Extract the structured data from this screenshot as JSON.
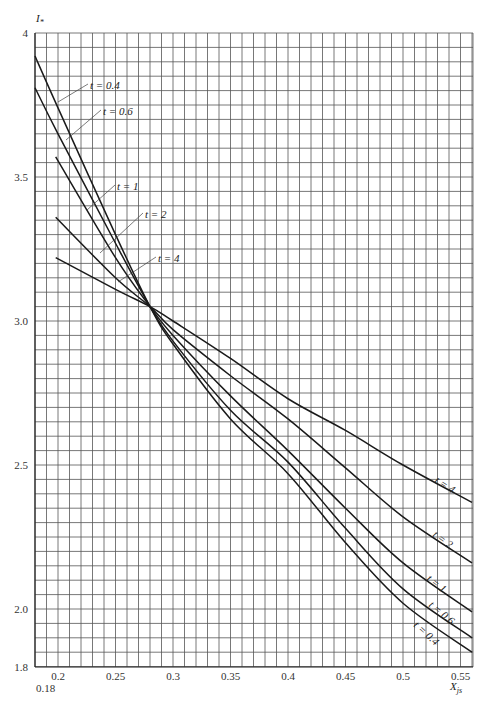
{
  "chart_data": {
    "type": "line",
    "title": "",
    "xlabel": "X_js",
    "ylabel": "I*",
    "xlim": [
      0.18,
      0.56
    ],
    "ylim": [
      1.8,
      4.0
    ],
    "grid": true,
    "x_ticks": [
      "0.2",
      "0.25",
      "0.3",
      "0.35",
      "0.4",
      "0.45",
      "0.5",
      "0.55"
    ],
    "x_tick_values": [
      0.2,
      0.25,
      0.3,
      0.35,
      0.4,
      0.45,
      0.5,
      0.55
    ],
    "x_origin_label": "0.18",
    "y_ticks": [
      "4",
      "3.5",
      "3.0",
      "2.5",
      "2.0",
      "1.8"
    ],
    "y_tick_values": [
      4.0,
      3.5,
      3.0,
      2.5,
      2.0,
      1.8
    ],
    "legend_position": "inline labels with leader lines",
    "series": [
      {
        "name": "t = 0.4",
        "x": [
          0.18,
          0.2,
          0.25,
          0.28,
          0.3,
          0.35,
          0.4,
          0.45,
          0.5,
          0.56
        ],
        "values": [
          3.92,
          3.74,
          3.3,
          3.05,
          2.92,
          2.66,
          2.47,
          2.23,
          2.02,
          1.85
        ]
      },
      {
        "name": "t = 0.6",
        "x": [
          0.18,
          0.2,
          0.25,
          0.28,
          0.3,
          0.35,
          0.4,
          0.45,
          0.5,
          0.56
        ],
        "values": [
          3.81,
          3.65,
          3.27,
          3.05,
          2.93,
          2.69,
          2.51,
          2.28,
          2.07,
          1.9
        ]
      },
      {
        "name": "t = 1",
        "x": [
          0.198,
          0.25,
          0.28,
          0.3,
          0.35,
          0.4,
          0.45,
          0.5,
          0.56
        ],
        "values": [
          3.57,
          3.22,
          3.05,
          2.95,
          2.74,
          2.55,
          2.35,
          2.16,
          1.99
        ]
      },
      {
        "name": "t = 2",
        "x": [
          0.198,
          0.25,
          0.28,
          0.3,
          0.35,
          0.4,
          0.45,
          0.5,
          0.56
        ],
        "values": [
          3.36,
          3.15,
          3.05,
          2.97,
          2.81,
          2.66,
          2.49,
          2.32,
          2.16
        ]
      },
      {
        "name": "t = 4",
        "x": [
          0.198,
          0.25,
          0.28,
          0.3,
          0.35,
          0.4,
          0.45,
          0.5,
          0.56
        ],
        "values": [
          3.22,
          3.11,
          3.05,
          3.0,
          2.87,
          2.73,
          2.62,
          2.5,
          2.37
        ]
      }
    ],
    "annotations": [
      {
        "text": "t = 0.4",
        "position": "upper-left, leader to curve near x=0.22"
      },
      {
        "text": "t = 0.6",
        "position": "upper-left, leader to curve near x=0.22"
      },
      {
        "text": "t = 1",
        "position": "leader to curve near x=0.23"
      },
      {
        "text": "t = 2",
        "position": "leader to curve near x=0.23"
      },
      {
        "text": "t = 4",
        "position": "leader to curve near x=0.24"
      },
      {
        "text": "t = 4",
        "position": "right side, along curve"
      },
      {
        "text": "t = 2",
        "position": "right side, along curve"
      },
      {
        "text": "t = 1",
        "position": "right side, along curve"
      },
      {
        "text": "t = 0.6",
        "position": "right side, along curve"
      },
      {
        "text": "t = 0.4",
        "position": "right side, along curve"
      }
    ]
  },
  "labels": {
    "y_axis_symbol": "I",
    "y_axis_sub": "*",
    "x_axis_symbol": "X",
    "x_axis_sub": "js",
    "left_labels": [
      "t = 0.4",
      "t = 0.6",
      "t = 1",
      "t = 2",
      "t = 4"
    ],
    "right_labels": [
      "t = 4",
      "t = 2",
      "t = 1",
      "t = 0.6",
      "t = 0.4"
    ]
  },
  "colors": {
    "curve": "#1a1a1a",
    "grid": "#555555",
    "axis_text": "#333333"
  }
}
